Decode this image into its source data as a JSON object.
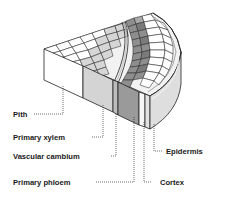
{
  "diagram": {
    "labels": {
      "pith": "Pith",
      "primary_xylem": "Primary xylem",
      "vascular_cambium": "Vascular cambium",
      "primary_phloem": "Primary phloem",
      "epidermis": "Epidermis",
      "cortex": "Cortex"
    },
    "colors": {
      "pith": "#ffffff",
      "primary_xylem": "#d4d4d4",
      "vascular_cambium": "#bcbcbc",
      "primary_phloem": "#9a9a9a",
      "cortex": "#f4f4f4",
      "epidermis": "#d8d8d8",
      "outline": "#222222"
    }
  }
}
